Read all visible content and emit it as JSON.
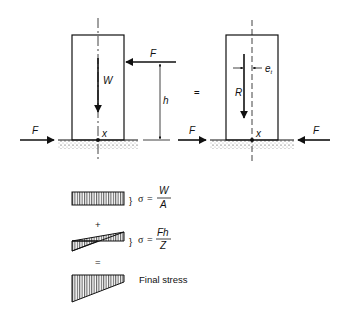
{
  "diagram": {
    "left_block": {
      "labels": {
        "top_force": "F",
        "weight": "W",
        "height": "h",
        "base_force": "F",
        "point": "x"
      }
    },
    "equals_sign": "=",
    "right_block": {
      "labels": {
        "resultant": "R",
        "eccentricity": "e",
        "eccentricity_sub": "t",
        "left_force": "F",
        "right_force": "F",
        "point": "x"
      }
    },
    "stress": {
      "uniform": {
        "sigma": "σ",
        "eq": "=",
        "num": "W",
        "den": "A"
      },
      "plus": "+",
      "bending": {
        "sigma": "σ",
        "eq": "=",
        "num": "Fh",
        "den": "Z"
      },
      "equals": "=",
      "final": {
        "label": "Final stress"
      }
    }
  }
}
